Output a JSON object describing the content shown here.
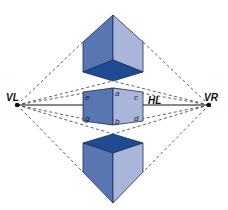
{
  "diagram": {
    "type": "two-point perspective",
    "labels": {
      "vanishing_left": "VL",
      "vanishing_right": "VR",
      "horizon_line": "HL",
      "corners": [
        "a",
        "b",
        "c",
        "d",
        "e",
        "g"
      ]
    },
    "colors": {
      "left_face": "#5876b2",
      "right_face": "#a9b6da",
      "dark_face": "#1f4b93",
      "edge": "#1b2d55",
      "construction_line": "#333333",
      "background": "#ffffff"
    },
    "cubes": [
      {
        "name": "cube-above-horizon",
        "shows": "bottom face"
      },
      {
        "name": "cube-on-horizon",
        "shows": "two side faces"
      },
      {
        "name": "cube-below-horizon",
        "shows": "top face"
      }
    ]
  }
}
